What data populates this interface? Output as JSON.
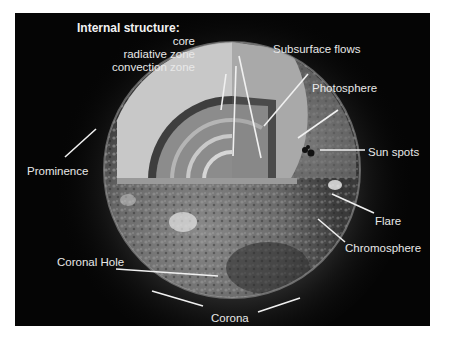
{
  "figure": {
    "title": "Internal structure:",
    "internal_structure": [
      "core",
      "radiative zone",
      "convection zone"
    ],
    "labels": {
      "subsurface_flows": "Subsurface flows",
      "photosphere": "Photosphere",
      "sun_spots": "Sun spots",
      "prominence": "Prominence",
      "flare": "Flare",
      "coronal_hole": "Coronal Hole",
      "chromosphere": "Chromosphere",
      "corona": "Corona"
    },
    "colors": {
      "background": "#050505",
      "frame": "#ffffff",
      "label_text": "#e8e8e8",
      "arrow": "#f0f0f0"
    }
  }
}
